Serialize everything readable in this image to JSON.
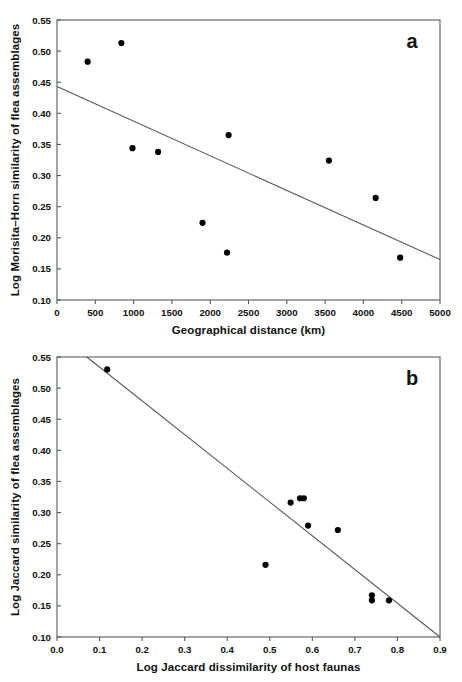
{
  "figure": {
    "background_color": "#ffffff",
    "point_color": "#000000",
    "line_color": "#555555",
    "axis_color": "#5a5a5a"
  },
  "chart_data": [
    {
      "panel": "a",
      "panel_label": "a",
      "type": "scatter",
      "title": "",
      "xlabel": "Geographical distance (km)",
      "ylabel": "Log Morisita–Horn similarity of flea assemblages",
      "xlim": [
        0,
        5000
      ],
      "ylim": [
        0.1,
        0.55
      ],
      "xticks": [
        0,
        500,
        1000,
        1500,
        2000,
        2500,
        3000,
        3500,
        4000,
        4500,
        5000
      ],
      "xtick_labels": [
        "0",
        "500",
        "1000",
        "1500",
        "2000",
        "2500",
        "3000",
        "3500",
        "4000",
        "4500",
        "5000"
      ],
      "yticks": [
        0.1,
        0.15,
        0.2,
        0.25,
        0.3,
        0.35,
        0.4,
        0.45,
        0.5,
        0.55
      ],
      "ytick_labels": [
        "0.10",
        "0.15",
        "0.20",
        "0.25",
        "0.30",
        "0.35",
        "0.40",
        "0.45",
        "0.50",
        "0.55"
      ],
      "grid": false,
      "legend": "none",
      "points": [
        {
          "x": 400,
          "y": 0.483
        },
        {
          "x": 840,
          "y": 0.513
        },
        {
          "x": 985,
          "y": 0.344
        },
        {
          "x": 1320,
          "y": 0.338
        },
        {
          "x": 1900,
          "y": 0.224
        },
        {
          "x": 2220,
          "y": 0.176
        },
        {
          "x": 2240,
          "y": 0.365
        },
        {
          "x": 3550,
          "y": 0.324
        },
        {
          "x": 4160,
          "y": 0.264
        },
        {
          "x": 4480,
          "y": 0.168
        }
      ],
      "trendline": {
        "x_start": 0,
        "y_start": 0.443,
        "x_end": 5000,
        "y_end": 0.165
      }
    },
    {
      "panel": "b",
      "panel_label": "b",
      "type": "scatter",
      "title": "",
      "xlabel": "Log Jaccard dissimilarity of host faunas",
      "ylabel": "Log Jaccard similarity of flea assemblages",
      "xlim": [
        0.0,
        0.9
      ],
      "ylim": [
        0.1,
        0.55
      ],
      "xticks": [
        0.0,
        0.1,
        0.2,
        0.3,
        0.4,
        0.5,
        0.6,
        0.7,
        0.8,
        0.9
      ],
      "xtick_labels": [
        "0.0",
        "0.1",
        "0.2",
        "0.3",
        "0.4",
        "0.5",
        "0.6",
        "0.7",
        "0.8",
        "0.9"
      ],
      "yticks": [
        0.1,
        0.15,
        0.2,
        0.25,
        0.3,
        0.35,
        0.4,
        0.45,
        0.5,
        0.55
      ],
      "ytick_labels": [
        "0.10",
        "0.15",
        "0.20",
        "0.25",
        "0.30",
        "0.35",
        "0.40",
        "0.45",
        "0.50",
        "0.55"
      ],
      "grid": false,
      "legend": "none",
      "points": [
        {
          "x": 0.118,
          "y": 0.53
        },
        {
          "x": 0.49,
          "y": 0.216
        },
        {
          "x": 0.549,
          "y": 0.316
        },
        {
          "x": 0.571,
          "y": 0.323
        },
        {
          "x": 0.58,
          "y": 0.323
        },
        {
          "x": 0.59,
          "y": 0.279
        },
        {
          "x": 0.66,
          "y": 0.272
        },
        {
          "x": 0.74,
          "y": 0.167
        },
        {
          "x": 0.74,
          "y": 0.159
        },
        {
          "x": 0.78,
          "y": 0.159
        }
      ],
      "trendline": {
        "x_start": 0.07,
        "y_start": 0.55,
        "x_end": 0.9,
        "y_end": 0.1
      }
    }
  ]
}
